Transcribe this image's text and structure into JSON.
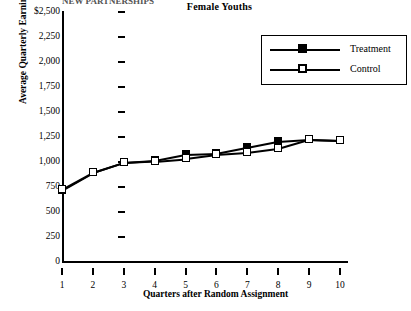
{
  "clipped_header": "NEW PARTNERSHIPS",
  "chart_title": "Female Youths",
  "legend": {
    "items": [
      {
        "label": "Treatment",
        "marker": "filled-square"
      },
      {
        "label": "Control",
        "marker": "open-square"
      }
    ]
  },
  "axes": {
    "ylabels": [
      "$2,500",
      "2,250",
      "2,000",
      "1,750",
      "1,500",
      "1,250",
      "1,000",
      "750",
      "500",
      "250",
      "0"
    ],
    "yvalues": [
      2500,
      2250,
      2000,
      1750,
      1500,
      1250,
      1000,
      750,
      500,
      250,
      0
    ],
    "xlabels": [
      "1",
      "2",
      "3",
      "4",
      "5",
      "6",
      "7",
      "8",
      "9",
      "10"
    ],
    "ytitle": "Average Quarterly Earnings",
    "xtitle": "Quarters after Random Assignment"
  },
  "chart_data": {
    "type": "line",
    "title": "Female Youths",
    "xlabel": "Quarters after Random Assignment",
    "ylabel": "Average Quarterly Earnings",
    "x": [
      1,
      2,
      3,
      4,
      5,
      6,
      7,
      8,
      9,
      10
    ],
    "ylim": [
      0,
      2500
    ],
    "ytick_step": 250,
    "grid": false,
    "legend_position": "top-right",
    "series": [
      {
        "name": "Treatment",
        "marker": "filled-square",
        "values": [
          725,
          900,
          1000,
          1020,
          1080,
          1090,
          1150,
          1210,
          1230,
          1220
        ]
      },
      {
        "name": "Control",
        "marker": "open-square",
        "values": [
          730,
          900,
          1000,
          1015,
          1040,
          1080,
          1100,
          1140,
          1230,
          1220
        ]
      }
    ]
  }
}
